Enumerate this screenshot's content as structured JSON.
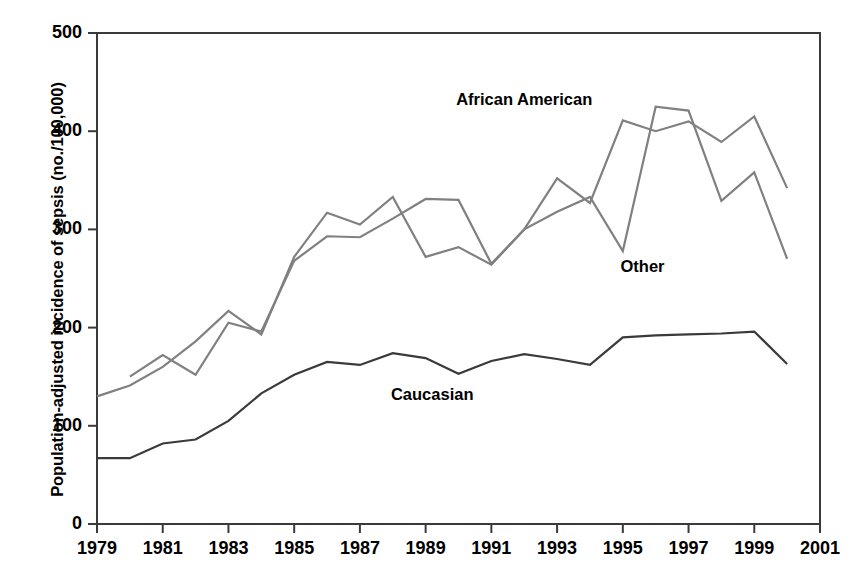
{
  "chart_data": {
    "type": "line",
    "title": "",
    "xlabel": "",
    "ylabel": "Population-adjusted incidence of sepsis (no./100,000)",
    "xlim": [
      1979,
      2001
    ],
    "ylim": [
      0,
      500
    ],
    "yticks": [
      0,
      100,
      200,
      300,
      400,
      500
    ],
    "ytick_labels": [
      "0",
      "100",
      "200",
      "300",
      "400",
      "500"
    ],
    "xticks": [
      1979,
      1981,
      1983,
      1985,
      1987,
      1989,
      1991,
      1993,
      1995,
      1997,
      1999,
      2001
    ],
    "xtick_labels": [
      "1979",
      "1981",
      "1983",
      "1985",
      "1987",
      "1989",
      "1991",
      "1993",
      "1995",
      "1997",
      "1999",
      "2001"
    ],
    "grid": false,
    "legend_position": "inline-annotations",
    "series": [
      {
        "name": "African American",
        "color": "#808080",
        "x": [
          1980,
          1981,
          1982,
          1983,
          1984,
          1985,
          1986,
          1987,
          1988,
          1989,
          1990,
          1991,
          1992,
          1993,
          1994,
          1995,
          1996,
          1997,
          1998,
          1999,
          2000
        ],
        "values": [
          150,
          172,
          152,
          205,
          196,
          268,
          293,
          292,
          311,
          331,
          330,
          265,
          300,
          352,
          327,
          411,
          400,
          410,
          389,
          415,
          342
        ]
      },
      {
        "name": "Other",
        "color": "#808080",
        "x": [
          1979,
          1980,
          1981,
          1982,
          1983,
          1984,
          1985,
          1986,
          1987,
          1988,
          1989,
          1990,
          1991,
          1992,
          1993,
          1994,
          1995,
          1996,
          1997,
          1998,
          1999,
          2000
        ],
        "values": [
          130,
          141,
          160,
          186,
          217,
          193,
          272,
          317,
          305,
          333,
          272,
          282,
          264,
          300,
          318,
          333,
          278,
          425,
          421,
          329,
          358,
          270
        ]
      },
      {
        "name": "Caucasian",
        "color": "#3a3a3a",
        "x": [
          1979,
          1980,
          1981,
          1982,
          1983,
          1984,
          1985,
          1986,
          1987,
          1988,
          1989,
          1990,
          1991,
          1992,
          1993,
          1994,
          1995,
          1996,
          1997,
          1998,
          1999,
          2000
        ],
        "values": [
          67,
          67,
          82,
          86,
          105,
          133,
          152,
          165,
          162,
          174,
          169,
          153,
          166,
          173,
          168,
          162,
          190,
          192,
          193,
          194,
          196,
          163
        ]
      }
    ],
    "annotations": [
      {
        "text": "African American",
        "x": 1992.0,
        "y": 432
      },
      {
        "text": "Other",
        "x": 1995.6,
        "y": 262
      },
      {
        "text": "Caucasian",
        "x": 1989.2,
        "y": 131
      }
    ]
  }
}
